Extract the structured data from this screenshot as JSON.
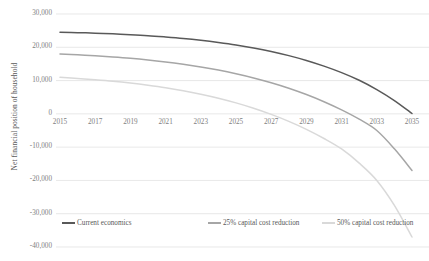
{
  "chart_data": {
    "type": "line",
    "title": "",
    "xlabel": "",
    "ylabel": "Net financial position of household",
    "xlim": [
      2015,
      2035
    ],
    "ylim": [
      -40000,
      30000
    ],
    "grid": true,
    "legend_position": "bottom",
    "x_ticks": [
      "2015",
      "2017",
      "2019",
      "2021",
      "2023",
      "2025",
      "2027",
      "2029",
      "2031",
      "2033",
      "2035"
    ],
    "y_ticks": [
      "30,000",
      "20,000",
      "10,000",
      "0",
      "-10,000",
      "-20,000",
      "-30,000",
      "-40,000"
    ],
    "y_tick_values": [
      30000,
      20000,
      10000,
      0,
      -10000,
      -20000,
      -30000,
      -40000
    ],
    "x": [
      2015,
      2016,
      2017,
      2018,
      2019,
      2020,
      2021,
      2022,
      2023,
      2024,
      2025,
      2026,
      2027,
      2028,
      2029,
      2030,
      2031,
      2032,
      2033,
      2034,
      2035
    ],
    "series": [
      {
        "name": "Current economics",
        "color": "#595959",
        "values": [
          24500,
          24400,
          24250,
          24050,
          23800,
          23500,
          23100,
          22650,
          22100,
          21450,
          20700,
          19800,
          18750,
          17500,
          16050,
          14350,
          12400,
          10100,
          7300,
          4000,
          100
        ]
      },
      {
        "name": "25% capital cost reduction",
        "color": "#a6a6a6",
        "values": [
          18000,
          17750,
          17450,
          17100,
          16700,
          16200,
          15600,
          14900,
          14100,
          13150,
          12050,
          10800,
          9350,
          7700,
          5800,
          3650,
          1200,
          -1600,
          -5000,
          -10500,
          -17000
        ]
      },
      {
        "name": "50% capital cost reduction",
        "color": "#d9d9d9",
        "values": [
          11000,
          10650,
          10250,
          9800,
          9250,
          8600,
          7850,
          6950,
          5900,
          4700,
          3300,
          1700,
          -150,
          -2250,
          -4650,
          -7400,
          -10550,
          -14800,
          -20000,
          -27500,
          -37000
        ]
      }
    ]
  },
  "legend": {
    "items": [
      {
        "label": "Current economics"
      },
      {
        "label": "25% capital cost reduction"
      },
      {
        "label": "50% capital cost reduction"
      }
    ]
  }
}
